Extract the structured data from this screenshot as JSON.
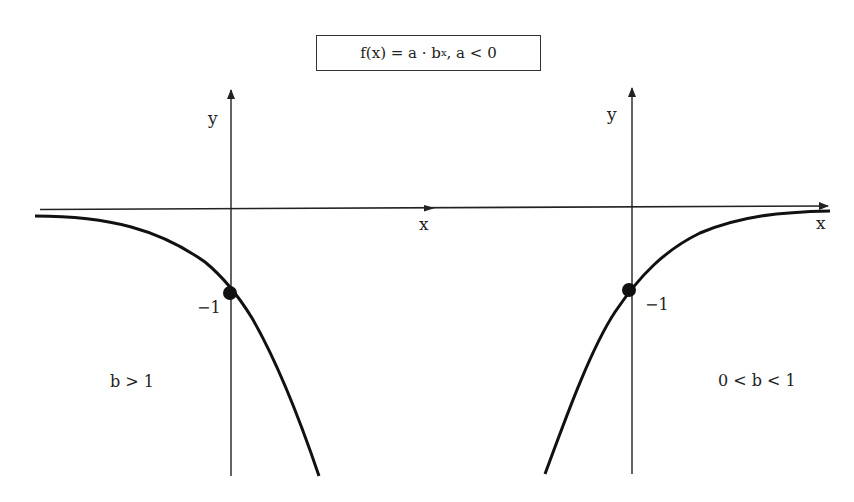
{
  "formula": {
    "prefix": "f(x) = a · b",
    "exponent": "x",
    "suffix": ", a < 0"
  },
  "left_graph": {
    "y_label": "y",
    "x_label": "x",
    "intercept_label": "−1",
    "condition_label": "b > 1"
  },
  "right_graph": {
    "y_label": "y",
    "x_label": "x",
    "intercept_label": "−1",
    "condition_label": "0 < b < 1"
  },
  "colors": {
    "stroke": "#111111",
    "axis": "#222222",
    "background": "#ffffff"
  }
}
